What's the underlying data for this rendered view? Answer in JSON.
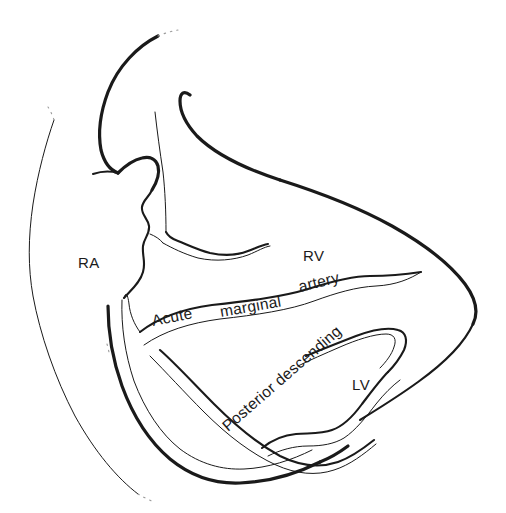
{
  "figure": {
    "type": "anatomical-line-diagram",
    "background_color": "#ffffff",
    "ink_color": "#1a1a1a",
    "faded_ink_color": "#9a9a9a",
    "width": 506,
    "height": 513
  },
  "labels": {
    "right_atrium": "RA",
    "right_ventricle": "RV",
    "left_ventricle": "LV",
    "acute_marginal_word1": "Acute",
    "acute_marginal_word2": "marginal",
    "acute_marginal_word3": "artery",
    "posterior_descending": "Posterior descending"
  },
  "label_positions": {
    "right_atrium": {
      "x": 78,
      "y": 262,
      "rotation": 0
    },
    "right_ventricle": {
      "x": 303,
      "y": 255,
      "rotation": 0
    },
    "left_ventricle": {
      "x": 352,
      "y": 384,
      "rotation": 0
    },
    "acute": {
      "x": 155,
      "y": 322,
      "rotation": -11
    },
    "marginal": {
      "x": 222,
      "y": 313,
      "rotation": -9
    },
    "artery": {
      "x": 300,
      "y": 288,
      "rotation": -13
    },
    "posterior_descending": {
      "x": 228,
      "y": 430,
      "rotation": -41
    }
  },
  "structures": [
    {
      "name": "superior-vena-cava",
      "kind": "vessel-outline"
    },
    {
      "name": "inferior-vena-cava",
      "kind": "vessel-outline"
    },
    {
      "name": "right-atrium-border",
      "kind": "chamber-outline"
    },
    {
      "name": "right-ventricle-border",
      "kind": "chamber-outline"
    },
    {
      "name": "left-ventricle-border",
      "kind": "chamber-outline"
    },
    {
      "name": "atrioventricular-groove",
      "kind": "groove"
    },
    {
      "name": "right-coronary-artery",
      "kind": "artery"
    },
    {
      "name": "acute-marginal-artery",
      "kind": "artery"
    },
    {
      "name": "posterior-descending-artery",
      "kind": "artery"
    },
    {
      "name": "pulmonary-artery-stub",
      "kind": "vessel-outline"
    }
  ]
}
